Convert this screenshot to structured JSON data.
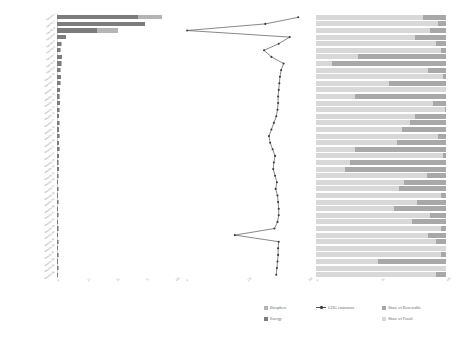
{
  "figure": {
    "background": "#ffffff",
    "panel_count": 3
  },
  "legend": {
    "position": "bottom-center-right",
    "items": [
      {
        "label": "Biosphere",
        "type": "swatch",
        "color": "#b4b4b4"
      },
      {
        "label": "Energy",
        "type": "swatch",
        "color": "#7c7c7c"
      },
      {
        "label": "GHG emissions",
        "type": "line",
        "color": "#555555"
      },
      {
        "label": "Share of Renewable",
        "type": "swatch",
        "color": "#a8a8a8"
      },
      {
        "label": "Share of Fossil",
        "type": "swatch",
        "color": "#d8d8d8"
      }
    ]
  },
  "chart_data": [
    {
      "id": "footprint",
      "type": "bar",
      "orientation": "horizontal",
      "stacked": true,
      "title": "",
      "xlabel": "",
      "ylabel": "",
      "grid": false,
      "xlim": [
        0,
        100
      ],
      "xticks": [
        "0",
        "25",
        "50",
        "75",
        "100"
      ],
      "categories": [
        "Country 1",
        "Country 2",
        "Country 3",
        "Country 4",
        "Country 5",
        "Country 6",
        "Country 7",
        "Country 8",
        "Country 9",
        "Country 10",
        "Country 11",
        "Country 12",
        "Country 13",
        "Country 14",
        "Country 15",
        "Country 16",
        "Country 17",
        "Country 18",
        "Country 19",
        "Country 20",
        "Country 21",
        "Country 22",
        "Country 23",
        "Country 24",
        "Country 25",
        "Country 26",
        "Country 27",
        "Country 28",
        "Country 29",
        "Country 30",
        "Country 31",
        "Country 32",
        "Country 33",
        "Country 34",
        "Country 35",
        "Country 36",
        "Country 37",
        "Country 38",
        "Country 39",
        "Country 40"
      ],
      "series": [
        {
          "name": "Energy",
          "color": "#7c7c7c",
          "values": [
            69.0,
            74.5,
            34.0,
            7.5,
            3.2,
            2.6,
            4.4,
            3.0,
            2.4,
            3.6,
            2.2,
            2.8,
            2.0,
            2.4,
            1.8,
            2.1,
            1.6,
            1.9,
            1.5,
            1.7,
            1.3,
            1.5,
            1.2,
            1.3,
            1.1,
            1.2,
            1.0,
            1.1,
            0.9,
            1.0,
            0.8,
            0.9,
            0.8,
            0.8,
            0.7,
            0.7,
            0.6,
            0.6,
            0.5,
            0.5
          ]
        },
        {
          "name": "Biosphere",
          "color": "#b4b4b4",
          "values": [
            20.0,
            0.0,
            18.0,
            0.0,
            0.7,
            0.5,
            0.0,
            0.5,
            0.4,
            0.0,
            0.4,
            0.0,
            0.3,
            0.0,
            0.3,
            0.0,
            0.3,
            0.0,
            0.2,
            0.0,
            0.2,
            0.0,
            0.2,
            0.0,
            0.2,
            0.0,
            0.2,
            0.0,
            0.1,
            0.0,
            0.1,
            0.0,
            0.1,
            0.0,
            0.1,
            0.0,
            0.1,
            0.0,
            0.1,
            0.0
          ]
        }
      ]
    },
    {
      "id": "ghg-emissions",
      "type": "line",
      "orientation": "horizontal",
      "title": "",
      "xlabel": "",
      "ylabel": "",
      "grid": false,
      "xlim": [
        0,
        100
      ],
      "xticks": [
        "0",
        "250",
        "500"
      ],
      "marker": "circle",
      "color": "#555555",
      "categories": [
        "Country 1",
        "Country 2",
        "Country 3",
        "Country 4",
        "Country 5",
        "Country 6",
        "Country 7",
        "Country 8",
        "Country 9",
        "Country 10",
        "Country 11",
        "Country 12",
        "Country 13",
        "Country 14",
        "Country 15",
        "Country 16",
        "Country 17",
        "Country 18",
        "Country 19",
        "Country 20",
        "Country 21",
        "Country 22",
        "Country 23",
        "Country 24",
        "Country 25",
        "Country 26",
        "Country 27",
        "Country 28",
        "Country 29",
        "Country 30",
        "Country 31",
        "Country 32",
        "Country 33",
        "Country 34",
        "Country 35",
        "Country 36",
        "Country 37",
        "Country 38",
        "Country 39",
        "Country 40"
      ],
      "values": [
        92.0,
        65.0,
        1.0,
        85.0,
        76.0,
        64.0,
        70.0,
        80.0,
        78.0,
        77.0,
        76.5,
        76.0,
        75.5,
        75.5,
        75.0,
        74.0,
        72.0,
        70.0,
        68.0,
        69.0,
        71.0,
        73.0,
        72.0,
        71.5,
        73.0,
        74.5,
        73.5,
        75.0,
        75.5,
        76.0,
        76.0,
        75.0,
        72.5,
        40.0,
        76.0,
        75.5,
        75.5,
        75.0,
        74.5,
        74.0
      ]
    },
    {
      "id": "energy-mix",
      "type": "bar",
      "orientation": "horizontal",
      "stacked": true,
      "title": "",
      "xlabel": "",
      "ylabel": "",
      "grid": false,
      "xlim": [
        0,
        100
      ],
      "xticks": [
        "0",
        "50",
        "100"
      ],
      "categories": [
        "Country 1",
        "Country 2",
        "Country 3",
        "Country 4",
        "Country 5",
        "Country 6",
        "Country 7",
        "Country 8",
        "Country 9",
        "Country 10",
        "Country 11",
        "Country 12",
        "Country 13",
        "Country 14",
        "Country 15",
        "Country 16",
        "Country 17",
        "Country 18",
        "Country 19",
        "Country 20",
        "Country 21",
        "Country 22",
        "Country 23",
        "Country 24",
        "Country 25",
        "Country 26",
        "Country 27",
        "Country 28",
        "Country 29",
        "Country 30",
        "Country 31",
        "Country 32",
        "Country 33",
        "Country 34",
        "Country 35",
        "Country 36",
        "Country 37",
        "Country 38",
        "Country 39",
        "Country 40"
      ],
      "series": [
        {
          "name": "Share of Fossil",
          "color": "#d8d8d8",
          "values": [
            82,
            94,
            88,
            76,
            92,
            96,
            32,
            12,
            86,
            98,
            56,
            100,
            30,
            90,
            99,
            76,
            72,
            66,
            94,
            62,
            30,
            98,
            26,
            22,
            85,
            68,
            64,
            96,
            78,
            60,
            88,
            74,
            96,
            86,
            92,
            100,
            96,
            48,
            100,
            92
          ]
        },
        {
          "name": "Share of Renewable",
          "color": "#a8a8a8",
          "values": [
            18,
            6,
            12,
            24,
            8,
            4,
            68,
            88,
            14,
            2,
            44,
            0,
            70,
            10,
            1,
            24,
            28,
            34,
            6,
            38,
            70,
            2,
            74,
            78,
            15,
            32,
            36,
            4,
            22,
            40,
            12,
            26,
            4,
            14,
            8,
            0,
            4,
            52,
            0,
            8
          ]
        }
      ]
    }
  ]
}
